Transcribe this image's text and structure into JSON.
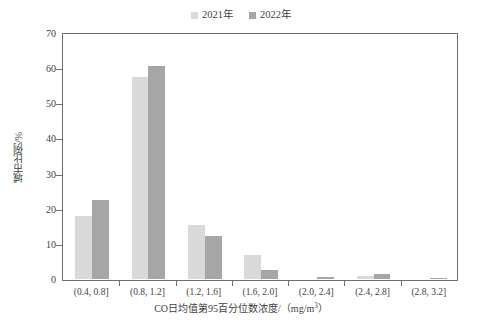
{
  "chart_data": {
    "type": "bar",
    "title": "",
    "xlabel": "CO日均值第95百分位数浓度/（mg/m³）",
    "ylabel": "城市比例/%",
    "categories": [
      "(0.4, 0.8]",
      "(0.8, 1.2]",
      "(1.2, 1.6]",
      "(1.6, 2.0]",
      "(2.0, 2.4]",
      "(2.4, 2.8]",
      "(2.8, 3.2]"
    ],
    "series": [
      {
        "name": "2021年",
        "color": "#d9d9d9",
        "values": [
          18.0,
          57.5,
          15.5,
          6.7,
          0.0,
          1.0,
          0.0
        ]
      },
      {
        "name": "2022年",
        "color": "#a6a6a6",
        "values": [
          22.5,
          60.5,
          12.3,
          2.7,
          0.5,
          1.3,
          0.2
        ]
      }
    ],
    "ylim": [
      0,
      70
    ],
    "ytick_step": 10,
    "yticks": [
      0,
      10,
      20,
      30,
      40,
      50,
      60,
      70
    ],
    "grid": false,
    "legend_position": "top-center",
    "frame": true
  },
  "legend": {
    "entries": [
      {
        "label": "2021年",
        "color": "#d9d9d9"
      },
      {
        "label": "2022年",
        "color": "#a6a6a6"
      }
    ]
  },
  "axes": {
    "y_title": "城市比例/%",
    "x_title_prefix": "CO日均值第95百分位数浓度/（mg/m",
    "x_title_sup": "3",
    "x_title_suffix": "）"
  }
}
